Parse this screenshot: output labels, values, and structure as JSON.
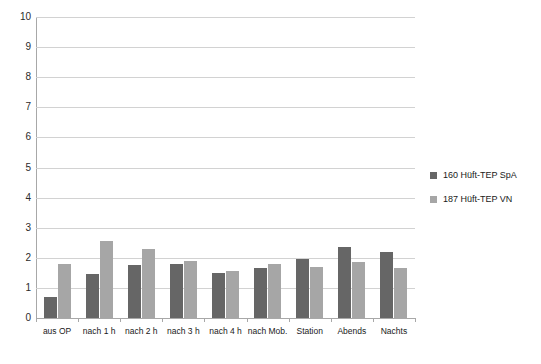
{
  "chart_data": {
    "type": "bar",
    "title": "",
    "subtitle": "",
    "xlabel": "",
    "ylabel": "",
    "ylim": [
      0,
      10
    ],
    "yticks": [
      "0",
      "1",
      "2",
      "3",
      "4",
      "5",
      "6",
      "7",
      "8",
      "9",
      "10"
    ],
    "grid": true,
    "legend_position": "right",
    "categories": [
      "aus OP",
      "nach 1 h",
      "nach 2 h",
      "nach 3 h",
      "nach 4 h",
      "nach Mob.",
      "Station",
      "Abends",
      "Nachts"
    ],
    "series": [
      {
        "name": "160 Hüft-TEP SpA",
        "color": "#666666",
        "values": [
          0.7,
          1.45,
          1.75,
          1.8,
          1.5,
          1.65,
          1.95,
          2.35,
          2.2
        ]
      },
      {
        "name": "187 Hüft-TEP VN",
        "color": "#a6a6a6",
        "values": [
          1.8,
          2.55,
          2.3,
          1.9,
          1.55,
          1.8,
          1.7,
          1.85,
          1.65
        ]
      }
    ]
  }
}
